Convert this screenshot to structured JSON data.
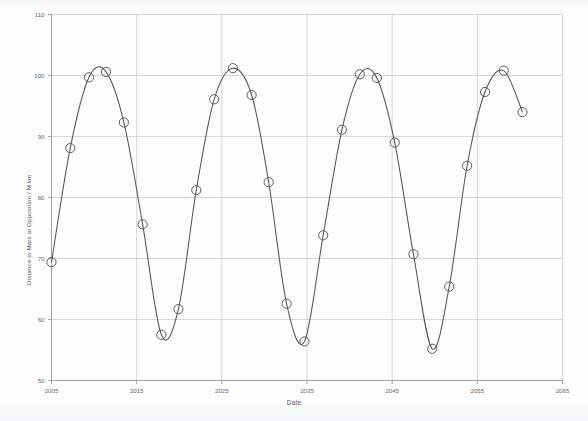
{
  "chart_data": {
    "type": "line",
    "title": "",
    "subtitle": "",
    "xlabel": "Date",
    "ylabel": "Distance to Mars at Opposition / M km",
    "xlim": [
      2005,
      2065
    ],
    "ylim": [
      50,
      110
    ],
    "xticks": [
      2005,
      2015,
      2025,
      2035,
      2045,
      2055,
      2065
    ],
    "yticks": [
      50,
      60,
      70,
      80,
      90,
      100,
      110
    ],
    "xtick_labels": [
      "2005",
      "2015",
      "2025",
      "2035",
      "2045",
      "2055",
      "2065"
    ],
    "ytick_labels": [
      "50",
      "60",
      "70",
      "80",
      "90",
      "100",
      "110"
    ],
    "grid": true,
    "legend": "none",
    "marker": "open-circle",
    "line_color": "#555555",
    "marker_color": "#555555",
    "grid_color": "#c8c8c8",
    "axis_color": "#9a9a9a",
    "series": [
      {
        "name": "Distance to Mars at Opposition",
        "x": [
          2005.0,
          2007.2,
          2009.4,
          2011.4,
          2013.5,
          2015.7,
          2017.9,
          2019.9,
          2022.0,
          2024.1,
          2026.3,
          2028.5,
          2030.5,
          2032.6,
          2034.7,
          2036.9,
          2039.1,
          2041.2,
          2043.2,
          2045.3,
          2047.5,
          2049.7,
          2051.7,
          2053.8,
          2055.9,
          2058.1,
          2060.3
        ],
        "y": [
          69.4,
          88.1,
          99.7,
          100.6,
          92.3,
          75.6,
          57.5,
          61.7,
          81.2,
          96.1,
          101.2,
          96.8,
          82.5,
          62.6,
          56.4,
          73.8,
          91.1,
          100.2,
          99.6,
          89.0,
          70.7,
          55.2,
          65.4,
          85.2,
          97.3,
          100.8,
          94.0
        ]
      }
    ]
  }
}
